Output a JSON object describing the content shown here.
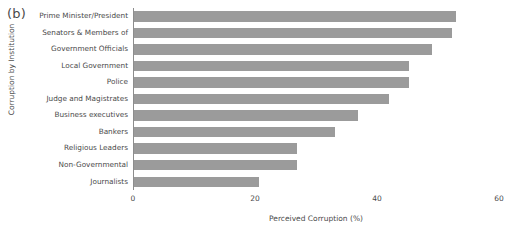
{
  "figure": {
    "panel_label": "(b)"
  },
  "chart_data": {
    "type": "bar",
    "orientation": "horizontal",
    "title": "",
    "xlabel": "Perceived Corruption (%)",
    "ylabel": "Corruption by Institution",
    "xlim": [
      0,
      60
    ],
    "xticks": [
      0,
      20,
      40,
      60
    ],
    "xtick_labels": [
      "0",
      "20",
      "40",
      "60"
    ],
    "grid": false,
    "legend": "none",
    "bar_color": "#9b9b9b",
    "axis_color": "#8d8d8d",
    "text_color": "#4a4a4a",
    "categories": [
      "Prime Minister/President",
      "Senators & Members of",
      "Government Officials",
      "Local Government",
      "Police",
      "Judge and Magistrates",
      "Business executives",
      "Bankers",
      "Religious Leaders",
      "Non-Governmental",
      "Journalists"
    ],
    "values": [
      52.8,
      52.1,
      48.9,
      45.1,
      45.1,
      41.8,
      36.7,
      33.0,
      26.7,
      26.7,
      20.5
    ]
  }
}
